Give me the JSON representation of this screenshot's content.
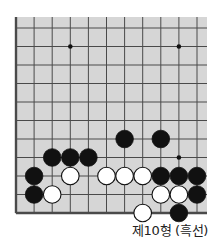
{
  "diagram": {
    "type": "go-board-fragment",
    "caption": "제10형 (흑선)",
    "board": {
      "columns": 11,
      "rows": 11,
      "left_edge_visible": true,
      "bottom_edge_visible": true,
      "background": "#d6d6d6",
      "line_color": "#4a4a4a"
    },
    "star_points": [
      {
        "col": 3,
        "row": 1
      },
      {
        "col": 9,
        "row": 1
      },
      {
        "col": 9,
        "row": 7
      }
    ],
    "stones": [
      {
        "color": "black",
        "col": 6,
        "row": 6
      },
      {
        "color": "black",
        "col": 8,
        "row": 6
      },
      {
        "color": "black",
        "col": 2,
        "row": 7
      },
      {
        "color": "black",
        "col": 3,
        "row": 7
      },
      {
        "color": "black",
        "col": 4,
        "row": 7
      },
      {
        "color": "black",
        "col": 1,
        "row": 8
      },
      {
        "color": "white",
        "col": 3,
        "row": 8
      },
      {
        "color": "white",
        "col": 5,
        "row": 8
      },
      {
        "color": "white",
        "col": 6,
        "row": 8
      },
      {
        "color": "white",
        "col": 7,
        "row": 8
      },
      {
        "color": "black",
        "col": 8,
        "row": 8
      },
      {
        "color": "black",
        "col": 9,
        "row": 8
      },
      {
        "color": "black",
        "col": 10,
        "row": 8
      },
      {
        "color": "black",
        "col": 1,
        "row": 9
      },
      {
        "color": "white",
        "col": 2,
        "row": 9
      },
      {
        "color": "white",
        "col": 8,
        "row": 9
      },
      {
        "color": "white",
        "col": 9,
        "row": 9
      },
      {
        "color": "black",
        "col": 10,
        "row": 9
      },
      {
        "color": "white",
        "col": 7,
        "row": 10
      },
      {
        "color": "black",
        "col": 9,
        "row": 10
      }
    ]
  }
}
